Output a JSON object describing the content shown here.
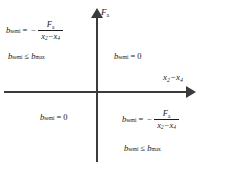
{
  "figure": {
    "type": "quadrant-diagram",
    "background_color": "#ffffff",
    "axis_color": "#3b3b3b",
    "text_color": "#1a1a1a"
  },
  "axes": {
    "vertical": {
      "label_var": "F",
      "label_sub": "a",
      "arrow": "up",
      "name": "F_a"
    },
    "horizontal": {
      "label_var_1": "x",
      "label_sub_1": "2",
      "operator": "−",
      "label_var_2": "x",
      "label_sub_2": "4",
      "arrow": "right",
      "name": "x_2 - x_4"
    }
  },
  "quadrants": {
    "q2": {
      "position": "top-left",
      "equation": {
        "lhs_var": "b",
        "lhs_sub": "semi",
        "equals": "=",
        "sign": "−",
        "numerator_var": "F",
        "numerator_sub": "a",
        "denominator_var_1": "x",
        "denominator_sub_1": "2",
        "denominator_op": "−",
        "denominator_var_2": "x",
        "denominator_sub_2": "4",
        "plain": "b_semi = - F_a / (x_2 - x_4)"
      },
      "constraint": {
        "lhs_var": "b",
        "lhs_sub": "semi",
        "relation": "≤",
        "rhs_var": "b",
        "rhs_sub": "max",
        "plain": "b_semi <= b_max"
      }
    },
    "q1": {
      "position": "top-right",
      "equation": {
        "lhs_var": "b",
        "lhs_sub": "semi",
        "equals": "=",
        "value": "0",
        "plain": "b_semi = 0"
      }
    },
    "q3": {
      "position": "bottom-left",
      "equation": {
        "lhs_var": "b",
        "lhs_sub": "semi",
        "equals": "=",
        "value": "0",
        "plain": "b_semi = 0"
      }
    },
    "q4": {
      "position": "bottom-right",
      "equation": {
        "lhs_var": "b",
        "lhs_sub": "semi",
        "equals": "=",
        "sign": "−",
        "numerator_var": "F",
        "numerator_sub": "a",
        "denominator_var_1": "x",
        "denominator_sub_1": "2",
        "denominator_op": "−",
        "denominator_var_2": "x",
        "denominator_sub_2": "4",
        "plain": "b_semi = - F_a / (x_2 - x_4)"
      },
      "constraint": {
        "lhs_var": "b",
        "lhs_sub": "semi",
        "relation": "≤",
        "rhs_var": "b",
        "rhs_sub": "max",
        "plain": "b_semi <= b_max"
      }
    }
  }
}
